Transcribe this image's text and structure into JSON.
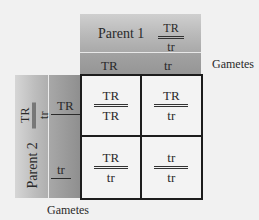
{
  "diagram": {
    "type": "punnett-square",
    "parent1": {
      "label": "Parent 1",
      "genotype": {
        "top": "TR",
        "bottom": "tr"
      },
      "gametes": [
        "TR",
        "tr"
      ]
    },
    "parent2": {
      "label": "Parent 2",
      "genotype": {
        "top": "TR",
        "bottom": "tr"
      },
      "gametes": [
        "TR",
        "tr"
      ]
    },
    "gametes_label_right": "Gametes",
    "gametes_label_bottom": "Gametes",
    "cells": [
      [
        {
          "top": "TR",
          "bottom": "TR"
        },
        {
          "top": "TR",
          "bottom": "tr"
        }
      ],
      [
        {
          "top": "TR",
          "bottom": "tr"
        },
        {
          "top": "tr",
          "bottom": "tr"
        }
      ]
    ]
  }
}
